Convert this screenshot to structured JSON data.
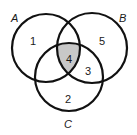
{
  "diagram": {
    "type": "venn",
    "sets": [
      {
        "name": "A",
        "label": "A"
      },
      {
        "name": "B",
        "label": "B"
      },
      {
        "name": "C",
        "label": "C"
      }
    ],
    "regions": [
      {
        "id": "A_only",
        "label": "1",
        "shaded": false
      },
      {
        "id": "C_only",
        "label": "2",
        "shaded": false
      },
      {
        "id": "B_and_C_only",
        "label": "3",
        "shaded": false
      },
      {
        "id": "A_and_B_and_C",
        "label": "4",
        "shaded": true
      },
      {
        "id": "B_only",
        "label": "5",
        "shaded": false
      }
    ],
    "colors": {
      "stroke": "#111111",
      "shade": "#c8c8c8",
      "background": "#ffffff"
    }
  }
}
